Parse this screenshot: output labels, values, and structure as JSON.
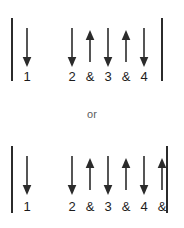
{
  "page": {
    "background_color": "#ffffff",
    "ink_color": "#2b2b2b",
    "separator_label": "or"
  },
  "patterns": [
    {
      "name": "strumming-pattern-1",
      "barline_left": "|",
      "barline_right": "|",
      "slots": [
        {
          "x": 27,
          "arrow": "down",
          "count": "1"
        },
        {
          "x": 50,
          "arrow": "none",
          "count": ""
        },
        {
          "x": 72,
          "arrow": "down",
          "count": "2"
        },
        {
          "x": 90,
          "arrow": "up",
          "count": "&"
        },
        {
          "x": 108,
          "arrow": "down",
          "count": "3"
        },
        {
          "x": 126,
          "arrow": "up",
          "count": "&"
        },
        {
          "x": 144,
          "arrow": "down",
          "count": "4"
        }
      ]
    },
    {
      "name": "strumming-pattern-2",
      "barline_left": "|",
      "barline_right": "|",
      "slots": [
        {
          "x": 27,
          "arrow": "down",
          "count": "1"
        },
        {
          "x": 50,
          "arrow": "none",
          "count": ""
        },
        {
          "x": 72,
          "arrow": "down",
          "count": "2"
        },
        {
          "x": 90,
          "arrow": "up",
          "count": "&"
        },
        {
          "x": 108,
          "arrow": "down",
          "count": "3"
        },
        {
          "x": 126,
          "arrow": "up",
          "count": "&"
        },
        {
          "x": 144,
          "arrow": "down",
          "count": "4"
        },
        {
          "x": 162,
          "arrow": "up",
          "count": "&"
        }
      ]
    }
  ]
}
